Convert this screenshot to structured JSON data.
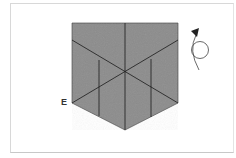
{
  "diagram": {
    "type": "origami-fold-step",
    "labels": {
      "corner_e": "E"
    },
    "colors": {
      "paper": "#8a8a8a",
      "crease": "#1a1a1a",
      "background": "#ffffff",
      "arrow": "#222222"
    },
    "symbols": [
      "turn-over-arrow"
    ]
  }
}
